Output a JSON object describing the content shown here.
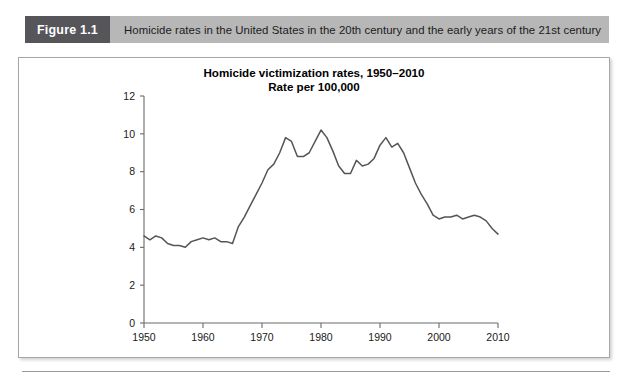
{
  "header": {
    "figure_tag": "Figure 1.1",
    "caption": "Homicide rates in the United States in the 20th century and the early years of the 21st century",
    "tag_bg": "#56565a",
    "bar_bg": "#b7b7b7"
  },
  "chart_data": {
    "type": "line",
    "title": "Homicide victimization rates, 1950–2010",
    "subtitle": "Rate per 100,000",
    "xlabel": "",
    "ylabel": "",
    "xlim": [
      1950,
      2010
    ],
    "ylim": [
      0,
      12
    ],
    "grid": false,
    "legend": "none",
    "line_color": "#555555",
    "xticks": [
      1950,
      1960,
      1970,
      1980,
      1990,
      2000,
      2010
    ],
    "xtick_labels": [
      "1950",
      "1960",
      "1970",
      "1980",
      "1990",
      "2000",
      "2010"
    ],
    "yticks": [
      0,
      2,
      4,
      6,
      8,
      10,
      12
    ],
    "ytick_labels": [
      "0",
      "2",
      "4",
      "6",
      "8",
      "10",
      "12"
    ],
    "series": [
      {
        "name": "Homicide victimization rate per 100,000",
        "x": [
          1950,
          1951,
          1952,
          1953,
          1954,
          1955,
          1956,
          1957,
          1958,
          1959,
          1960,
          1961,
          1962,
          1963,
          1964,
          1965,
          1966,
          1967,
          1968,
          1969,
          1970,
          1971,
          1972,
          1973,
          1974,
          1975,
          1976,
          1977,
          1978,
          1979,
          1980,
          1981,
          1982,
          1983,
          1984,
          1985,
          1986,
          1987,
          1988,
          1989,
          1990,
          1991,
          1992,
          1993,
          1994,
          1995,
          1996,
          1997,
          1998,
          1999,
          2000,
          2001,
          2002,
          2003,
          2004,
          2005,
          2006,
          2007,
          2008,
          2009,
          2010
        ],
        "values": [
          4.6,
          4.4,
          4.6,
          4.5,
          4.2,
          4.1,
          4.1,
          4.0,
          4.3,
          4.4,
          4.5,
          4.4,
          4.5,
          4.3,
          4.3,
          4.2,
          5.1,
          5.6,
          6.2,
          6.8,
          7.4,
          8.1,
          8.4,
          9.0,
          9.8,
          9.6,
          8.8,
          8.8,
          9.0,
          9.6,
          10.2,
          9.8,
          9.1,
          8.3,
          7.9,
          7.9,
          8.6,
          8.3,
          8.4,
          8.7,
          9.4,
          9.8,
          9.3,
          9.5,
          9.0,
          8.2,
          7.4,
          6.8,
          6.3,
          5.7,
          5.5,
          5.6,
          5.6,
          5.7,
          5.5,
          5.6,
          5.7,
          5.6,
          5.4,
          5.0,
          4.7
        ]
      }
    ]
  }
}
